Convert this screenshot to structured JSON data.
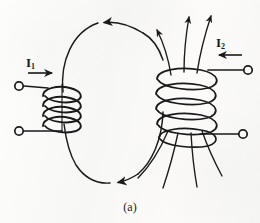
{
  "figure": {
    "caption": "(a)",
    "background_color": "#fbfbfa",
    "ink_color": "#1a1a1a",
    "width": 260,
    "height": 223
  },
  "labels": {
    "current_left": {
      "symbol": "I",
      "subscript": "1",
      "text": "I1",
      "direction": "right"
    },
    "current_right": {
      "symbol": "I",
      "subscript": "2",
      "text": "I2",
      "direction": "left"
    }
  },
  "coils": [
    {
      "id": "left-coil",
      "orientation": "horizontal",
      "turns": 4,
      "center_x": 62,
      "center_y": 107,
      "terminals": 2
    },
    {
      "id": "right-coil",
      "orientation": "vertical",
      "turns": 5,
      "center_x": 186,
      "center_y": 103,
      "terminals": 2
    }
  ],
  "terminals": [
    {
      "id": "left-upper-terminal",
      "cx": 19,
      "cy": 86
    },
    {
      "id": "left-lower-terminal",
      "cx": 19,
      "cy": 131
    },
    {
      "id": "right-upper-terminal",
      "cx": 248,
      "cy": 70
    },
    {
      "id": "right-lower-terminal",
      "cx": 243,
      "cy": 134
    }
  ],
  "flux": {
    "loop_arrow_top_direction": "left",
    "loop_arrow_bottom_direction": "right",
    "upward_arrow_count": 3,
    "lower_line_count": 4
  }
}
